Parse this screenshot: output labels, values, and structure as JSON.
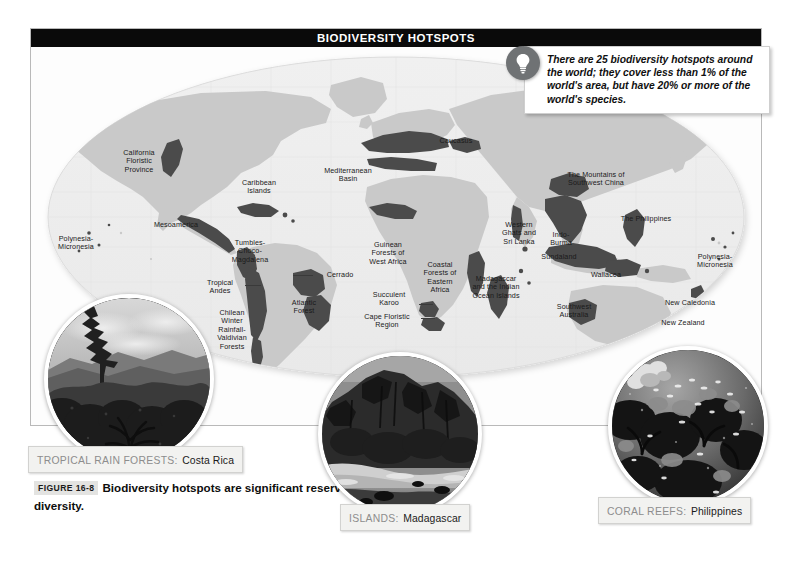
{
  "figure": {
    "title_bar": "BIODIVERSITY HOTSPOTS",
    "caption_badge": "FIGURE 16-8",
    "caption_text": "Biodiversity hotspots are significant reservoirs of biological diversity."
  },
  "callout": {
    "icon": "lightbulb-icon",
    "text": "There are 25 biodiversity hotspots around the world; they cover less than 1% of the world's area, but have 20% or more of the world's species."
  },
  "map": {
    "projection": "oval world map",
    "land_color": "#c9c9c9",
    "hotspot_color": "#4a4a4a",
    "ocean_color": "#f4f4f4",
    "labels": [
      {
        "id": "california-floristic-province",
        "text": "California\nFloristic\nProvince",
        "x": 108,
        "y": 110,
        "align": "ctr"
      },
      {
        "id": "caribbean-islands",
        "text": "Caribbean\nIslands",
        "x": 228,
        "y": 140,
        "align": "ctr"
      },
      {
        "id": "mesoamerica",
        "text": "Mesoamerica",
        "x": 145,
        "y": 178,
        "align": "ctr"
      },
      {
        "id": "polynesia-micronesia-west",
        "text": "Polynesia-\nMicronesia",
        "x": 42,
        "y": 196,
        "align": "ctr"
      },
      {
        "id": "tumbles-choco-magdalena",
        "text": "Tumbles-\nChoco-\nMagdalena",
        "x": 218,
        "y": 200,
        "align": "ctr"
      },
      {
        "id": "tropical-andes",
        "text": "Tropical\nAndes",
        "x": 192,
        "y": 238,
        "align": "ctr"
      },
      {
        "id": "cerrado",
        "text": "Cerrado",
        "x": 280,
        "y": 225,
        "align": "ctr"
      },
      {
        "id": "atlantic-forest",
        "text": "Atlantic\nForest",
        "x": 272,
        "y": 258,
        "align": "ctr"
      },
      {
        "id": "chilean-winter-rainfall-valdivian-forests",
        "text": "Chilean\nWinter\nRainfall-\nValdivian\nForests",
        "x": 200,
        "y": 270,
        "align": "ctr"
      },
      {
        "id": "mediterranean-basin",
        "text": "Mediterranean\nBasin",
        "x": 314,
        "y": 126,
        "align": "ctr"
      },
      {
        "id": "caucasus",
        "text": "Caucasus",
        "x": 428,
        "y": 96,
        "align": "ctr"
      },
      {
        "id": "guinean-forests-of-west-africa",
        "text": "Guinean\nForests of\nWest Africa",
        "x": 357,
        "y": 200,
        "align": "ctr"
      },
      {
        "id": "coastal-forests-of-eastern-africa",
        "text": "Coastal\nForests of\nEastern\nAfrica",
        "x": 409,
        "y": 220,
        "align": "ctr"
      },
      {
        "id": "succulent-karoo",
        "text": "Succulent\nKaroo",
        "x": 366,
        "y": 249,
        "align": "ctr"
      },
      {
        "id": "cape-floristic-region",
        "text": "Cape Floristic\nRegion",
        "x": 363,
        "y": 271,
        "align": "ctr"
      },
      {
        "id": "madagascar-and-the-indian-ocean-islands",
        "text": "Madagascar\nand the Indian\nOcean Islands",
        "x": 464,
        "y": 234,
        "align": "ctr"
      },
      {
        "id": "western-ghats-and-sri-lanka",
        "text": "Western\nGhats and\nSri Lanka",
        "x": 488,
        "y": 180,
        "align": "ctr"
      },
      {
        "id": "indo-burma",
        "text": "Indo-\nBurma",
        "x": 530,
        "y": 190,
        "align": "ctr"
      },
      {
        "id": "the-mountains-of-southwest-china",
        "text": "The Mountains of\nSouthwest China",
        "x": 565,
        "y": 130,
        "align": "ctr"
      },
      {
        "id": "the-philippines",
        "text": "The Philippines",
        "x": 615,
        "y": 173,
        "align": "ctr"
      },
      {
        "id": "sundaland",
        "text": "Sundaland",
        "x": 528,
        "y": 210,
        "align": "ctr"
      },
      {
        "id": "wallacea",
        "text": "Wallacea",
        "x": 576,
        "y": 229,
        "align": "ctr"
      },
      {
        "id": "southwest-australia",
        "text": "Southwest\nAustralia",
        "x": 543,
        "y": 262,
        "align": "ctr"
      },
      {
        "id": "polynesia-micronesia-east",
        "text": "Polynesia-\nMicronesia",
        "x": 690,
        "y": 212,
        "align": "ctr"
      },
      {
        "id": "new-caledonia",
        "text": "New Caledonia",
        "x": 676,
        "y": 256,
        "align": "ctr"
      },
      {
        "id": "new-zealand",
        "text": "New Zealand",
        "x": 669,
        "y": 276,
        "align": "ctr"
      }
    ]
  },
  "photos": [
    {
      "id": "tropical-rain-forests",
      "category": "TROPICAL RAIN FORESTS:",
      "place": "Costa Rica",
      "subject": "dense forest canopy with mountain and clouds"
    },
    {
      "id": "islands",
      "category": "ISLANDS:",
      "place": "Madagascar",
      "subject": "rocky island coastline with beach"
    },
    {
      "id": "coral-reefs",
      "category": "CORAL REEFS:",
      "place": "Philippines",
      "subject": "underwater coral reef with fish"
    }
  ]
}
